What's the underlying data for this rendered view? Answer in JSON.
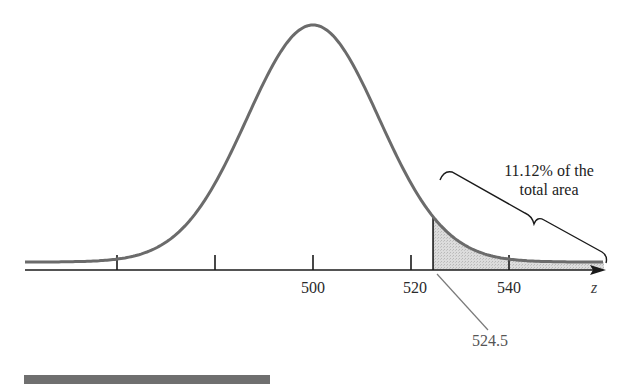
{
  "chart_data": {
    "type": "area",
    "title": "",
    "distribution": {
      "mean": 500,
      "approx_sd": 20
    },
    "x_axis": {
      "label": "z",
      "tick_positions": [
        460,
        480,
        500,
        520,
        540
      ],
      "tick_labels": [
        "",
        "",
        "500",
        "520",
        "540"
      ],
      "xlim": [
        453,
        560
      ]
    },
    "y_axis": {
      "visible": false
    },
    "shaded_region": {
      "from": 524.5,
      "to": "infinity",
      "percent_of_total_area": 11.12,
      "fill": "#d4d4d4"
    },
    "annotations": [
      {
        "text": "11.12% of the total area",
        "lines": [
          "11.12% of the",
          "total area"
        ],
        "target": "shaded right tail",
        "style": "brace"
      },
      {
        "text": "524.5",
        "target": "left boundary of shaded region",
        "style": "pointer line"
      }
    ],
    "grid": false,
    "legend": null
  },
  "labels": {
    "tick_500": "500",
    "tick_520": "520",
    "tick_540": "540",
    "axis_var": "z",
    "callout_line1": "11.12% of the",
    "callout_line2": "total area",
    "boundary_value": "524.5"
  },
  "colors": {
    "curve": "#6b6b6b",
    "axis": "#1a1a1a",
    "shade": "#d6d6d6",
    "footer_bar": "#6f6f6f"
  }
}
